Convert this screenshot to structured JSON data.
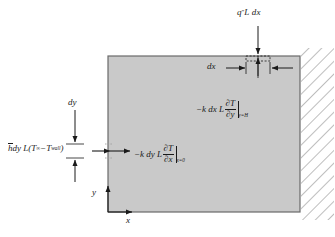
{
  "figure": {
    "background_color": "#ffffff",
    "block": {
      "fill_color": "#c9c9c9",
      "stroke_color": "#5a5a5a",
      "x": 108,
      "y": 56,
      "width": 192,
      "height": 156
    },
    "hatch": {
      "name": "wall-hatching",
      "color": "#9a9a9a",
      "x": 300,
      "y": 48,
      "width": 33,
      "height": 172
    }
  },
  "labels": {
    "heat_flux_top": {
      "q": "q",
      "superscript": "″",
      "rest": " L dx",
      "full": "q″ L dx"
    },
    "conduction_top": {
      "prefix": "−k dx L",
      "numerator": "∂T",
      "denominator": "∂y",
      "subscript": "y=H",
      "full": "−k dx L ∂T/∂y|y=H"
    },
    "conduction_left": {
      "prefix": "−k dy L",
      "numerator": "∂T",
      "denominator": "∂x",
      "subscript": "x=0",
      "full": "−k dy L ∂T/∂x|x=0"
    },
    "convection_left": {
      "h": "h",
      "mid": " dy L",
      "open": "(",
      "t_inf": "T",
      "t_inf_sub": "∞",
      "minus": "−",
      "t_wall": "T",
      "t_wall_sub": "wall",
      "close": ")",
      "full": "h̄ dy L (T∞ − Twall)"
    },
    "dx": "dx",
    "dy": "dy",
    "axis_x": "x",
    "axis_y": "y"
  }
}
